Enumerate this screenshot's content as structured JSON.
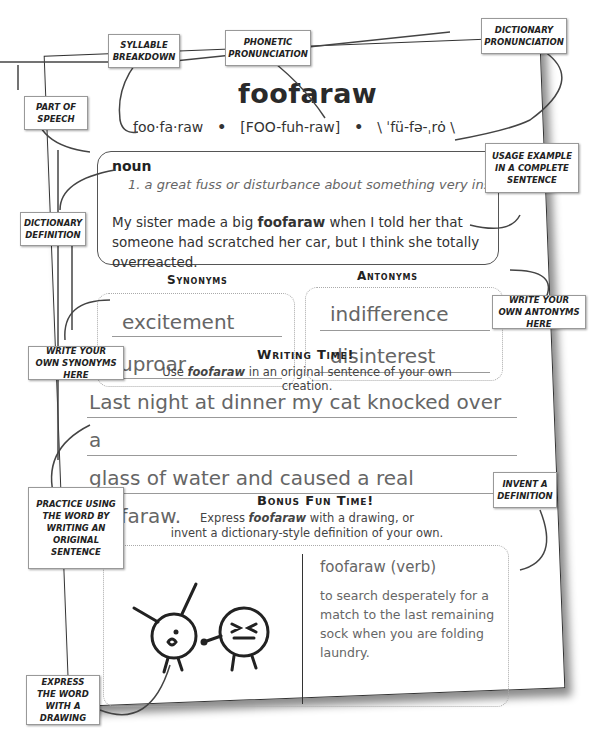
{
  "worksheet": {
    "headword": "foofaraw",
    "syllables": "foo·fa·raw",
    "separator": "•",
    "phonetic": "[FOO-fuh-raw]",
    "dictionary_pronunciation": "\\ ˈfü-fə-ˌrȯ \\",
    "part_of_speech": "noun",
    "definition": "1. a great fuss or disturbance about something very insignificant",
    "usage_before": "My sister made a big ",
    "usage_bold": "foofaraw",
    "usage_after": " when I told her that someone had scratched her car, but I think she totally overreacted.",
    "synonyms_heading": "Synonyms",
    "synonyms": [
      "excitement",
      "uproar"
    ],
    "antonyms_heading": "Antonyms",
    "antonyms": [
      "indifference",
      "disinterest"
    ],
    "writing_heading": "Writing Time!",
    "writing_instruction_before": "Use ",
    "writing_instruction_word": "foofaraw",
    "writing_instruction_after": " in an original sentence of your own creation.",
    "writing_sentence_line1": "Last night at dinner my cat knocked over a",
    "writing_sentence_line2": "glass of water and caused a real foofaraw.",
    "bonus_heading": "Bonus Fun Time!",
    "bonus_instruction_before": "Express ",
    "bonus_instruction_word": "foofaraw",
    "bonus_instruction_after": " with a drawing, or",
    "bonus_instruction_line2": "invent a dictionary-style definition of your own.",
    "invented_title": "foofaraw (verb)",
    "invented_definition": "to search desperately for a match to the last remaining sock when you are folding laundry."
  },
  "callouts": {
    "syllable_breakdown": "Syllable Breakdown",
    "phonetic_pronunciation": "Phonetic Pronunciation",
    "dictionary_pronunciation": "Dictionary Pronunciation",
    "part_of_speech": "Part of Speech",
    "usage_example": "Usage example in a complete sentence",
    "dictionary_definition": "Dictionary Definition",
    "write_antonyms": "Write your own antonyms here",
    "write_synonyms": "Write your own synonyms here",
    "practice_sentence": "Practice using the word by writing an original sentence",
    "invent_definition": "Invent a definition",
    "express_drawing": "Express the word with a drawing"
  }
}
